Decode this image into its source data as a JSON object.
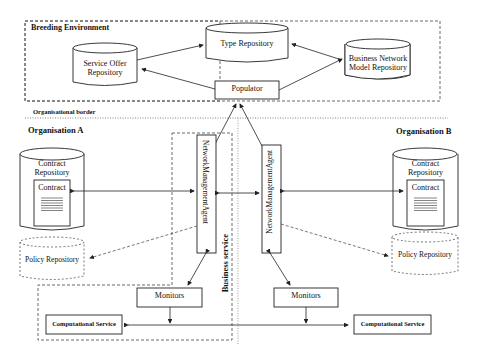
{
  "page_number": "154",
  "regions": {
    "breeding_environment": "Breeding Environment",
    "organisational_border": "Organisational border",
    "organisation_a": "Organisation A",
    "organisation_b": "Organisation B",
    "business_service": "Business service"
  },
  "nodes": {
    "type_repository": "Type Repository",
    "service_offer_repository_line1": "Service Offer",
    "service_offer_repository_line2": "Repository",
    "business_network_model_repository_line1": "Business Network",
    "business_network_model_repository_line2": "Model Repository",
    "populator": "Populator",
    "contract_repository_a_line1": "Contract",
    "contract_repository_a_line2": "Repository",
    "contract_a": "Contract",
    "contract_repository_b_line1": "Contract",
    "contract_repository_b_line2": "Repository",
    "contract_b": "Contract",
    "policy_repository_a": "Policy Repository",
    "policy_repository_b": "Policy Repository",
    "network_management_agent_a": "NetworkManagementAgent",
    "network_management_agent_b": "NetworkManagementAgent",
    "monitors_a": "Monitors",
    "monitors_b": "Monitors",
    "computational_service_a": "Computational Service",
    "computational_service_b": "Computational Service"
  },
  "colors": {
    "line": "#222222",
    "dashed": "#555555",
    "background": "#ffffff"
  }
}
